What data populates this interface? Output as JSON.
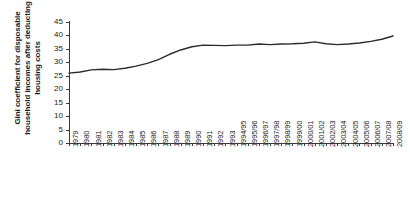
{
  "chart_data": {
    "type": "line",
    "title": "",
    "xlabel": "",
    "ylabel": "Gini coefficient for disposable household incomes after deducting housing costs",
    "ylabel_lines": [
      "Gini coefficient for disposable",
      "household incomes after deducting",
      "housing costs"
    ],
    "ylim": [
      0,
      45
    ],
    "yticks": [
      0,
      5,
      10,
      15,
      20,
      25,
      30,
      35,
      40,
      45
    ],
    "ytick_labels": [
      "0",
      "5",
      "10",
      "15",
      "20",
      "25",
      "30",
      "35",
      "40",
      "45"
    ],
    "grid": false,
    "legend": false,
    "legend_position": "none",
    "line_color": "#2b2b2b",
    "background_color": "#ffffff",
    "categories": [
      "1979",
      "1980",
      "1981",
      "1982",
      "1983",
      "1984",
      "1985",
      "1986",
      "1987",
      "1988",
      "1989",
      "1990",
      "1991",
      "1992",
      "1993",
      "1994/95",
      "1995/96",
      "1996/97",
      "1997/98",
      "1998/99",
      "1999/00",
      "2000/01",
      "2001/02",
      "2002/03",
      "2003/04",
      "2004/05",
      "2005/06",
      "2006/07",
      "2007/08",
      "2008/09"
    ],
    "series": [
      {
        "name": "Gini coefficient (after housing costs)",
        "values": [
          26.0,
          26.4,
          27.2,
          27.4,
          27.3,
          27.8,
          28.6,
          29.6,
          31.0,
          33.0,
          34.6,
          35.8,
          36.4,
          36.3,
          36.2,
          36.4,
          36.4,
          36.8,
          36.6,
          36.8,
          36.9,
          37.1,
          37.6,
          36.9,
          36.6,
          36.8,
          37.2,
          37.8,
          38.6,
          39.8
        ]
      }
    ]
  }
}
